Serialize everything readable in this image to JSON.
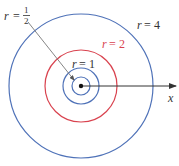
{
  "diagram": {
    "axis": {
      "label": "x"
    },
    "colors": {
      "blue": "#4f72b8",
      "red": "#d9434f",
      "axis": "#333333",
      "text": "#333333",
      "pointer": "#777777"
    },
    "circles": [
      {
        "r_value": "1/2",
        "color_key": "blue"
      },
      {
        "r_value": "1",
        "color_key": "blue"
      },
      {
        "r_value": "2",
        "color_key": "red"
      },
      {
        "r_value": "4",
        "color_key": "blue"
      }
    ],
    "labels": {
      "r_half": {
        "var": "r",
        "eq": "=",
        "num": "1",
        "den": "2"
      },
      "r_one": {
        "var": "r",
        "eq": "=",
        "val": "1"
      },
      "r_two": {
        "var": "r",
        "eq": "=",
        "val": "2"
      },
      "r_four": {
        "var": "r",
        "eq": "=",
        "val": "4"
      }
    }
  }
}
